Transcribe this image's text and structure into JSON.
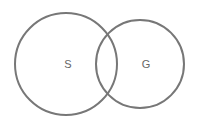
{
  "diagram": {
    "type": "venn",
    "stroke_color": "#777777",
    "sets": [
      {
        "label": "S",
        "cx": 66,
        "cy": 64,
        "r": 51
      },
      {
        "label": "G",
        "cx": 140,
        "cy": 64,
        "r": 44
      }
    ]
  }
}
